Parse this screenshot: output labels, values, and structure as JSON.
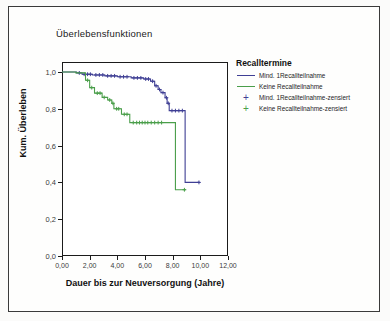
{
  "chart_data": {
    "type": "line",
    "subtype": "kaplan-meier-survival",
    "title": "Überlebensfunktionen",
    "xlabel": "Dauer bis zur Neuversorgung (Jahre)",
    "ylabel": "Kum. Überleben",
    "xlim": [
      0,
      12
    ],
    "ylim": [
      0,
      1
    ],
    "xticks": [
      "0,00",
      "2,00",
      "4,00",
      "6,00",
      "8,00",
      "10,00",
      "12,00"
    ],
    "xtick_values": [
      0,
      2,
      4,
      6,
      8,
      10,
      12
    ],
    "yticks": [
      "0,0",
      "0,2",
      "0,4",
      "0,6",
      "0,8",
      "1,0"
    ],
    "ytick_values": [
      0,
      0.2,
      0.4,
      0.6,
      0.8,
      1.0
    ],
    "grid": false,
    "legend_position": "right",
    "legend_title": "Recalltermine",
    "series": [
      {
        "name": "Mind. 1Recallteilnahme",
        "color": "#3f3f94",
        "steps": [
          [
            0.0,
            1.0
          ],
          [
            1.05,
            1.0
          ],
          [
            1.05,
            0.995
          ],
          [
            1.45,
            0.995
          ],
          [
            1.45,
            0.988
          ],
          [
            2.2,
            0.988
          ],
          [
            2.2,
            0.984
          ],
          [
            3.1,
            0.984
          ],
          [
            3.1,
            0.979
          ],
          [
            4.0,
            0.979
          ],
          [
            4.0,
            0.974
          ],
          [
            5.0,
            0.974
          ],
          [
            5.0,
            0.968
          ],
          [
            5.9,
            0.968
          ],
          [
            5.9,
            0.962
          ],
          [
            6.4,
            0.962
          ],
          [
            6.4,
            0.95
          ],
          [
            6.7,
            0.95
          ],
          [
            6.7,
            0.925
          ],
          [
            6.95,
            0.925
          ],
          [
            6.95,
            0.905
          ],
          [
            7.15,
            0.905
          ],
          [
            7.15,
            0.888
          ],
          [
            7.45,
            0.888
          ],
          [
            7.45,
            0.86
          ],
          [
            7.6,
            0.86
          ],
          [
            7.6,
            0.83
          ],
          [
            7.75,
            0.83
          ],
          [
            7.75,
            0.79
          ],
          [
            8.9,
            0.79
          ],
          [
            8.9,
            0.4
          ],
          [
            9.95,
            0.4
          ]
        ],
        "censored": [
          [
            1.25,
            0.995
          ],
          [
            1.6,
            0.988
          ],
          [
            1.85,
            0.988
          ],
          [
            2.05,
            0.988
          ],
          [
            2.45,
            0.984
          ],
          [
            2.7,
            0.984
          ],
          [
            2.95,
            0.984
          ],
          [
            3.3,
            0.979
          ],
          [
            3.55,
            0.979
          ],
          [
            3.8,
            0.979
          ],
          [
            4.2,
            0.974
          ],
          [
            4.45,
            0.974
          ],
          [
            4.7,
            0.974
          ],
          [
            5.2,
            0.968
          ],
          [
            5.45,
            0.968
          ],
          [
            5.7,
            0.968
          ],
          [
            6.05,
            0.962
          ],
          [
            6.25,
            0.962
          ],
          [
            6.55,
            0.95
          ],
          [
            6.8,
            0.925
          ],
          [
            7.05,
            0.905
          ],
          [
            7.3,
            0.888
          ],
          [
            7.55,
            0.86
          ],
          [
            7.68,
            0.83
          ],
          [
            7.95,
            0.79
          ],
          [
            8.2,
            0.79
          ],
          [
            8.45,
            0.79
          ],
          [
            8.7,
            0.79
          ],
          [
            9.9,
            0.4
          ]
        ]
      },
      {
        "name": "Keine Recallteilnahme",
        "color": "#4a9e4a",
        "steps": [
          [
            0.0,
            1.0
          ],
          [
            1.0,
            1.0
          ],
          [
            1.0,
            0.995
          ],
          [
            1.7,
            0.995
          ],
          [
            1.7,
            0.955
          ],
          [
            2.0,
            0.955
          ],
          [
            2.0,
            0.915
          ],
          [
            2.35,
            0.915
          ],
          [
            2.35,
            0.885
          ],
          [
            2.9,
            0.885
          ],
          [
            2.9,
            0.862
          ],
          [
            3.3,
            0.862
          ],
          [
            3.3,
            0.848
          ],
          [
            3.6,
            0.848
          ],
          [
            3.6,
            0.83
          ],
          [
            3.75,
            0.83
          ],
          [
            3.75,
            0.8
          ],
          [
            4.3,
            0.8
          ],
          [
            4.3,
            0.77
          ],
          [
            4.9,
            0.77
          ],
          [
            4.9,
            0.725
          ],
          [
            8.2,
            0.725
          ],
          [
            8.2,
            0.36
          ],
          [
            8.95,
            0.36
          ]
        ],
        "censored": [
          [
            1.85,
            0.955
          ],
          [
            2.15,
            0.915
          ],
          [
            2.55,
            0.885
          ],
          [
            2.75,
            0.885
          ],
          [
            3.05,
            0.862
          ],
          [
            3.45,
            0.848
          ],
          [
            3.68,
            0.83
          ],
          [
            3.95,
            0.8
          ],
          [
            4.1,
            0.8
          ],
          [
            4.5,
            0.77
          ],
          [
            4.7,
            0.77
          ],
          [
            5.15,
            0.725
          ],
          [
            5.4,
            0.725
          ],
          [
            5.6,
            0.725
          ],
          [
            5.8,
            0.725
          ],
          [
            6.0,
            0.725
          ],
          [
            6.2,
            0.725
          ],
          [
            6.45,
            0.725
          ],
          [
            6.7,
            0.725
          ],
          [
            6.95,
            0.725
          ],
          [
            7.2,
            0.725
          ],
          [
            8.85,
            0.36
          ]
        ]
      }
    ],
    "legend_entries": [
      {
        "label": "Mind. 1Recallteilnahme",
        "color": "#3f3f94",
        "marker": "line"
      },
      {
        "label": "Keine Recallteilnahme",
        "color": "#4a9e4a",
        "marker": "line"
      },
      {
        "label": "Mind. 1Recallteilnahme-zensiert",
        "color": "#3f3f94",
        "marker": "plus"
      },
      {
        "label": "Keine Recallteilnahme-zensiert",
        "color": "#4a9e4a",
        "marker": "plus"
      }
    ]
  }
}
